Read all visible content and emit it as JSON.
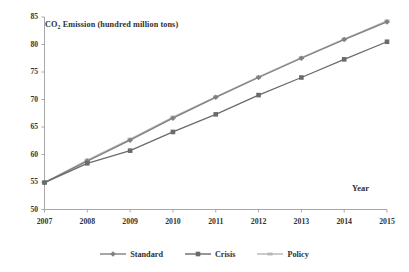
{
  "chart_data": {
    "type": "line",
    "title": "CO2 Emission (hundred million tons)",
    "title_prefix": "CO",
    "title_sub": "2",
    "title_suffix": " Emission (hundred million tons)",
    "xlabel": "Year",
    "ylabel": "",
    "x": [
      2007,
      2008,
      2009,
      2010,
      2011,
      2012,
      2013,
      2014,
      2015
    ],
    "categories": [
      "2007",
      "2008",
      "2009",
      "2010",
      "2011",
      "2012",
      "2013",
      "2014",
      "2015"
    ],
    "xlim": [
      2007,
      2015
    ],
    "ylim": [
      50,
      85
    ],
    "y_ticks": [
      50,
      55,
      60,
      65,
      70,
      75,
      80,
      85
    ],
    "y_tick_labels": [
      "50",
      "55",
      "60",
      "65",
      "70",
      "75",
      "80",
      "85"
    ],
    "grid": false,
    "legend_position": "bottom",
    "series": [
      {
        "name": "Standard",
        "color": "#808080",
        "marker": "diamond",
        "values": [
          54.9,
          58.8,
          62.6,
          66.6,
          70.4,
          74.0,
          77.5,
          80.9,
          84.1
        ]
      },
      {
        "name": "Crisis",
        "color": "#6b6b6b",
        "marker": "square",
        "values": [
          54.9,
          58.4,
          60.7,
          64.1,
          67.3,
          70.8,
          74.0,
          77.3,
          80.5
        ]
      },
      {
        "name": "Policy",
        "color": "#b5b5b5",
        "marker": "dash",
        "values": [
          54.9,
          59.0,
          62.8,
          66.8,
          70.5,
          74.1,
          77.6,
          81.0,
          84.3
        ]
      }
    ]
  },
  "legend": {
    "items": [
      {
        "label": "Standard"
      },
      {
        "label": "Crisis"
      },
      {
        "label": "Policy"
      }
    ]
  },
  "axis": {
    "y_labels": [
      "85",
      "80",
      "75",
      "70",
      "65",
      "60",
      "55",
      "50"
    ],
    "x_labels": [
      "2007",
      "2008",
      "2009",
      "2010",
      "2011",
      "2012",
      "2013",
      "2014",
      "2015"
    ]
  },
  "colors": {
    "standard": "#808080",
    "crisis": "#6b6b6b",
    "policy": "#b5b5b5",
    "axis": "#a8a8a8",
    "text": "#2f2f2f"
  }
}
